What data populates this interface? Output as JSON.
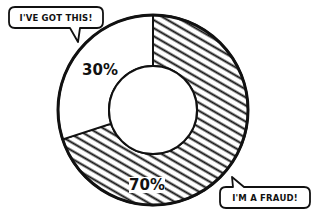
{
  "chart_data": {
    "type": "pie",
    "variant": "donut",
    "title": "",
    "slices": [
      {
        "label": "I'm a fraud!",
        "value": 70,
        "display": "70%",
        "pattern": "hatched"
      },
      {
        "label": "I've got this!",
        "value": 30,
        "display": "30%",
        "pattern": "plain"
      }
    ],
    "start_angle": "12 o'clock",
    "direction": "clockwise",
    "annotations": [
      {
        "text": "I'VE GOT THIS!",
        "points_to": "30% slice",
        "placement": "top-left"
      },
      {
        "text": "I'M A FRAUD!",
        "points_to": "70% slice",
        "placement": "bottom-right"
      }
    ]
  },
  "colors": {
    "ink": "#111111",
    "background": "#ffffff"
  }
}
